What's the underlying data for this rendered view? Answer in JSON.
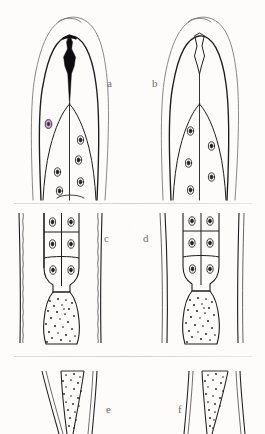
{
  "figure": {
    "background_color": "#fdfcfa",
    "ink_color": "#262428",
    "label_color": "#6f6d70",
    "accent_nucleus_color": "#8d6f9a",
    "panel_count": 6,
    "rows": 3,
    "columns": 2
  },
  "panels": [
    {
      "id": "a",
      "label": "a",
      "label_x": 107,
      "label_y": 78,
      "row": 1,
      "column": 1,
      "subject": "anterior end with solid sclerotized stylet",
      "stylet_fill": "solid-black",
      "nucleus_count": 6,
      "has_tinted_nucleus": true,
      "body_wall": "smooth"
    },
    {
      "id": "b",
      "label": "b",
      "label_x": 152,
      "label_y": 78,
      "row": 1,
      "column": 2,
      "subject": "anterior end with outlined stylet",
      "stylet_fill": "outline",
      "nucleus_count": 5,
      "has_tinted_nucleus": false,
      "body_wall": "smooth"
    },
    {
      "id": "c",
      "label": "c",
      "label_x": 104,
      "label_y": 233,
      "row": 2,
      "column": 1,
      "subject": "mid-body glandular region with cell compartments",
      "cell_rows": 3,
      "cell_columns": 2,
      "nucleus_count": 6,
      "granular_zone": true,
      "body_wall": "crenulated"
    },
    {
      "id": "d",
      "label": "d",
      "label_x": 143,
      "label_y": 233,
      "row": 2,
      "column": 2,
      "subject": "mid-body glandular region with cell compartments",
      "cell_rows": 3,
      "cell_columns": 2,
      "nucleus_count": 6,
      "granular_zone": true,
      "body_wall": "straight"
    },
    {
      "id": "e",
      "label": "e",
      "label_x": 106,
      "label_y": 404,
      "row": 3,
      "column": 1,
      "subject": "tapering granular gland lobe",
      "granular_zone": true,
      "taper_direction": "right",
      "body_wall": "straight"
    },
    {
      "id": "f",
      "label": "f",
      "label_x": 178,
      "label_y": 404,
      "row": 3,
      "column": 2,
      "subject": "tapering granular gland lobe",
      "granular_zone": true,
      "taper_direction": "left",
      "body_wall": "straight"
    }
  ],
  "dividers": [
    {
      "name": "divider-row1-row2",
      "y": 203
    },
    {
      "name": "divider-row2-row3",
      "y": 356
    }
  ]
}
